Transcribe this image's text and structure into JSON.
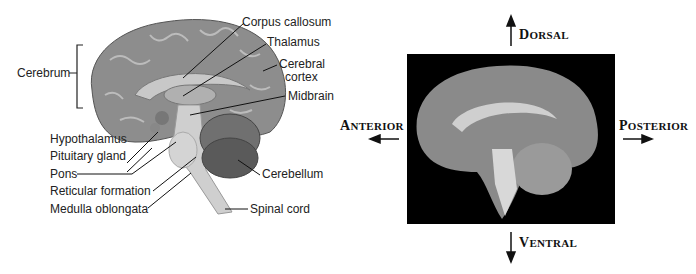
{
  "illustration": {
    "labels": {
      "cerebrum": "Cerebrum",
      "corpus_callosum": "Corpus callosum",
      "thalamus": "Thalamus",
      "cerebral_cortex_line1": "Cerebral",
      "cerebral_cortex_line2": "cortex",
      "midbrain": "Midbrain",
      "hypothalamus": "Hypothalamus",
      "pituitary_gland": "Pituitary gland",
      "pons": "Pons",
      "reticular_formation": "Reticular formation",
      "medulla_oblongata": "Medulla oblongata",
      "cerebellum": "Cerebellum",
      "spinal_cord": "Spinal cord"
    }
  },
  "photo": {
    "directions": {
      "dorsal_cap": "D",
      "dorsal_rest": "ORSAL",
      "ventral_cap": "V",
      "ventral_rest": "ENTRAL",
      "anterior_cap": "A",
      "anterior_rest": "NTERIOR",
      "posterior_cap": "P",
      "posterior_rest": "OSTERIOR"
    }
  }
}
